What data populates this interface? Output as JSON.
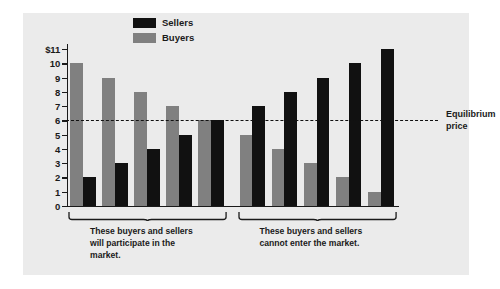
{
  "chart_data": {
    "type": "bar",
    "title": "",
    "xlabel": "",
    "ylabel": "",
    "ylim": [
      0,
      11
    ],
    "grid": false,
    "legend_position": "top-center",
    "categories": [
      "1",
      "2",
      "3",
      "4",
      "5",
      "6",
      "7",
      "8",
      "9",
      "10"
    ],
    "series": [
      {
        "name": "Sellers",
        "color": "#111111",
        "values": [
          2,
          3,
          4,
          5,
          6,
          7,
          8,
          9,
          10,
          11
        ]
      },
      {
        "name": "Buyers",
        "color": "#808080",
        "values": [
          10,
          9,
          8,
          7,
          6,
          5,
          4,
          3,
          2,
          1
        ]
      }
    ],
    "y_ticks": [
      {
        "value": 11,
        "label": "$11"
      },
      {
        "value": 10,
        "label": "10"
      },
      {
        "value": 9,
        "label": "9"
      },
      {
        "value": 8,
        "label": "8"
      },
      {
        "value": 7,
        "label": "7"
      },
      {
        "value": 6,
        "label": "6"
      },
      {
        "value": 5,
        "label": "5"
      },
      {
        "value": 4,
        "label": "4"
      },
      {
        "value": 3,
        "label": "3"
      },
      {
        "value": 2,
        "label": "2"
      },
      {
        "value": 1,
        "label": "1"
      },
      {
        "value": 0,
        "label": "0"
      }
    ],
    "annotations": [
      {
        "name": "equilibrium-price",
        "value": 6,
        "line1": "Equilibrium",
        "line2": "price",
        "style": "dashed"
      }
    ],
    "groups": [
      {
        "name": "participating",
        "pair_indices": [
          0,
          1,
          2,
          3,
          4
        ],
        "caption_line1": "These buyers and sellers",
        "caption_emphasis": "will",
        "caption_line2_rest": " participate in the",
        "caption_line3": "market."
      },
      {
        "name": "excluded",
        "pair_indices": [
          5,
          6,
          7,
          8,
          9
        ],
        "caption_line1": "These buyers and sellers",
        "caption_emphasis": "cannot",
        "caption_line2_rest": " enter the market.",
        "caption_line3": ""
      }
    ]
  },
  "legend": {
    "items": [
      {
        "label": "Sellers",
        "color": "#111111"
      },
      {
        "label": "Buyers",
        "color": "#808080"
      }
    ]
  },
  "colors": {
    "figure_background": "#ebebeb",
    "page_background": "#ffffff",
    "ink": "#1a1a1a",
    "sellers": "#111111",
    "buyers": "#808080"
  }
}
